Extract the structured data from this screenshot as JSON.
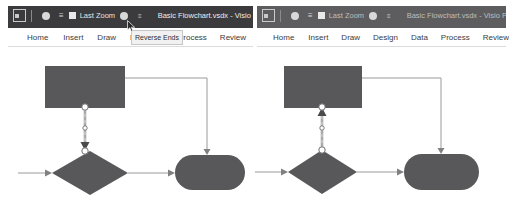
{
  "window": {
    "title": "Basic Flowchart.vsdx  -  Visio P",
    "app_icon": "visio-app-icon",
    "quick_access": [
      {
        "name": "save-icon",
        "glyph": "●"
      },
      {
        "name": "undo-icon",
        "glyph": "↺"
      },
      {
        "name": "last-zoom-icon",
        "glyph": "■"
      },
      {
        "name": "last-zoom-label",
        "label": "Last Zoom"
      },
      {
        "name": "redo-icon",
        "glyph": "●"
      },
      {
        "name": "customize-qat-caret",
        "glyph": "≡"
      }
    ]
  },
  "ribbon": {
    "tabs_left": [
      "Home",
      "Insert",
      "Draw",
      "De",
      "sign",
      "Process",
      "Review"
    ],
    "tabs_right": [
      "Home",
      "Insert",
      "Draw",
      "Design",
      "Data",
      "Process",
      "Review"
    ]
  },
  "tooltip": {
    "text": "Reverse Ends",
    "visible_on": "left"
  },
  "colors": {
    "shape_fill": "#58585a",
    "connector": "#808082",
    "titlebar_active": "#3b3b3d",
    "titlebar_inactive": "#5d5d5f",
    "tab_text": "#3b3b3d",
    "handle_fill": "#ffffff",
    "handle_stroke": "#6f6f71"
  },
  "diagram_left": {
    "caption": "connector selected, arrow points down into decision",
    "shapes": [
      {
        "name": "process-rectangle",
        "type": "rectangle"
      },
      {
        "name": "decision-diamond",
        "type": "diamond"
      },
      {
        "name": "terminator-stadium",
        "type": "stadium"
      }
    ],
    "connectors": [
      {
        "name": "connector-process-to-decision",
        "selected": true,
        "arrow_direction": "down"
      },
      {
        "name": "connector-process-to-terminator",
        "selected": false,
        "arrow_direction": "down"
      },
      {
        "name": "connector-decision-to-terminator",
        "selected": false,
        "arrow_direction": "right"
      },
      {
        "name": "connector-inbound-to-decision",
        "selected": false,
        "arrow_direction": "right"
      }
    ]
  },
  "diagram_right": {
    "caption": "after Reverse Ends, arrow points up into process",
    "shapes": [
      {
        "name": "process-rectangle",
        "type": "rectangle"
      },
      {
        "name": "decision-diamond",
        "type": "diamond"
      },
      {
        "name": "terminator-stadium",
        "type": "stadium"
      }
    ],
    "connectors": [
      {
        "name": "connector-decision-to-process",
        "selected": true,
        "arrow_direction": "up"
      },
      {
        "name": "connector-process-to-terminator",
        "selected": false,
        "arrow_direction": "down"
      },
      {
        "name": "connector-decision-to-terminator",
        "selected": false,
        "arrow_direction": "right"
      },
      {
        "name": "connector-inbound-to-decision",
        "selected": false,
        "arrow_direction": "right"
      }
    ]
  }
}
